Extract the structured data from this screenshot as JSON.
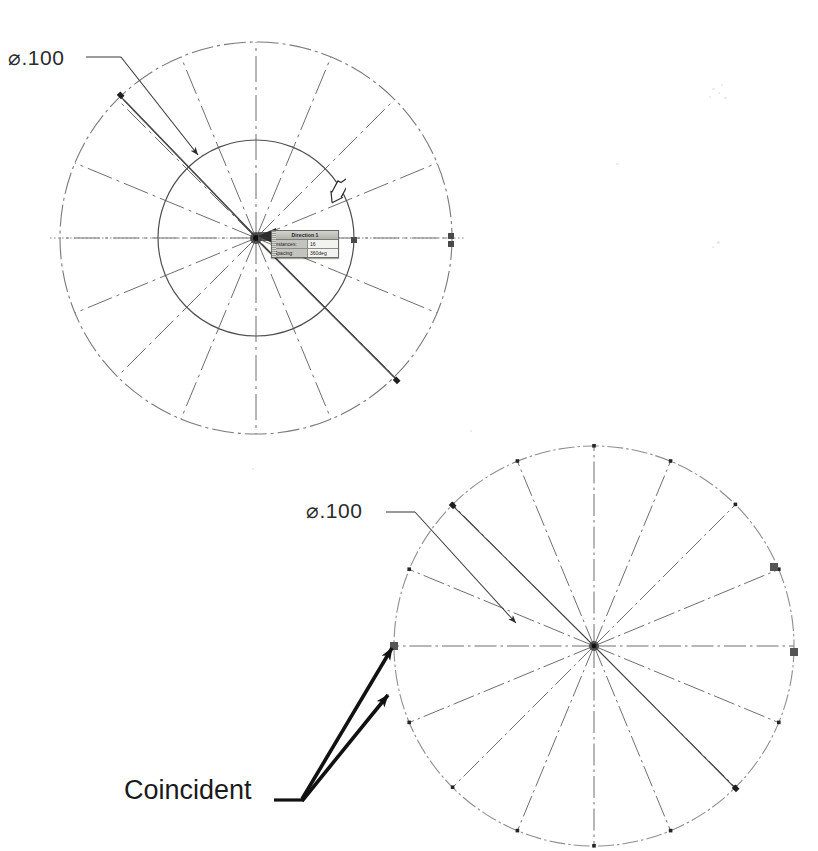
{
  "figure": {
    "background_color": "#ffffff",
    "line_color": "#5a5a5a",
    "annotation_color": "#1a1a1a"
  },
  "annotations": {
    "diameter_top": "⌀.100",
    "diameter_bottom": "⌀.100",
    "coincident_note": "Coincident"
  },
  "pattern_dialog": {
    "title": "Direction 1",
    "rows": [
      {
        "label": "Instances:",
        "value": "16"
      },
      {
        "label": "Spacing:",
        "value": "360deg"
      }
    ],
    "title_bar_color": "#c9c9c4",
    "field_color": "#f2f2ee"
  },
  "sketch_top": {
    "center_x": 256,
    "center_y": 238,
    "outer_radius": 196,
    "inner_radius": 98,
    "spoke_count": 16,
    "line_style": "phantom",
    "selected_handles": [
      {
        "x": 452,
        "y": 236
      },
      {
        "x": 452,
        "y": 243
      },
      {
        "x": 354,
        "y": 240
      }
    ]
  },
  "sketch_bottom": {
    "center_x": 594,
    "center_y": 646,
    "outer_radius": 200,
    "spoke_count": 16,
    "line_style": "center",
    "selected_handles": [
      {
        "x": 394,
        "y": 646
      },
      {
        "x": 794,
        "y": 652
      },
      {
        "x": 774,
        "y": 567
      }
    ]
  },
  "cursor": {
    "icon": "arrow-cursor-hollow",
    "x": 326,
    "y": 174
  },
  "leaders": {
    "top_dimension": {
      "from_x": 86,
      "from_y": 57,
      "to_x": 196,
      "to_y": 152
    },
    "bottom_dimension": {
      "from_x": 386,
      "from_y": 512,
      "to_x": 512,
      "to_y": 619
    },
    "coincident_arrow_1": {
      "from_x": 300,
      "from_y": 800,
      "to_x": 389,
      "to_y": 645
    },
    "coincident_arrow_2": {
      "from_x": 300,
      "from_y": 800,
      "to_x": 385,
      "to_y": 692
    }
  }
}
